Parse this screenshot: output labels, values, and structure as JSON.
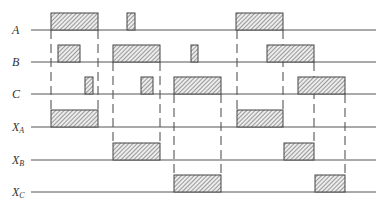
{
  "diagram": {
    "type": "timing-diagram",
    "line_x_start": 31,
    "line_x_end": 376,
    "pulse_height": 17,
    "colors": {
      "line": "#555555",
      "hatch": "#555555",
      "fill": "#e8e8e8"
    },
    "signals": [
      {
        "id": "A",
        "label": "A",
        "sub": "",
        "baseline_y": 30,
        "pulses": [
          {
            "x1": 51,
            "x2": 98
          },
          {
            "x1": 127,
            "x2": 135
          },
          {
            "x1": 236,
            "x2": 283
          }
        ]
      },
      {
        "id": "B",
        "label": "B",
        "sub": "",
        "baseline_y": 62,
        "pulses": [
          {
            "x1": 58,
            "x2": 80
          },
          {
            "x1": 113,
            "x2": 160
          },
          {
            "x1": 191,
            "x2": 198
          },
          {
            "x1": 267,
            "x2": 314
          }
        ]
      },
      {
        "id": "C",
        "label": "C",
        "sub": "",
        "baseline_y": 94,
        "pulses": [
          {
            "x1": 85,
            "x2": 93
          },
          {
            "x1": 141,
            "x2": 153
          },
          {
            "x1": 174,
            "x2": 221
          },
          {
            "x1": 298,
            "x2": 345
          }
        ]
      },
      {
        "id": "XA",
        "label": "X",
        "sub": "A",
        "baseline_y": 127,
        "pulses": [
          {
            "x1": 51,
            "x2": 98
          },
          {
            "x1": 237,
            "x2": 283
          }
        ]
      },
      {
        "id": "XB",
        "label": "X",
        "sub": "B",
        "baseline_y": 160,
        "pulses": [
          {
            "x1": 113,
            "x2": 160
          },
          {
            "x1": 284,
            "x2": 314
          }
        ]
      },
      {
        "id": "XC",
        "label": "X",
        "sub": "C",
        "baseline_y": 192,
        "pulses": [
          {
            "x1": 174,
            "x2": 221
          },
          {
            "x1": 315,
            "x2": 345
          }
        ]
      }
    ],
    "guides": [
      {
        "x": 51,
        "y1": 30,
        "y2": 110
      },
      {
        "x": 98,
        "y1": 30,
        "y2": 110
      },
      {
        "x": 113,
        "y1": 62,
        "y2": 143
      },
      {
        "x": 160,
        "y1": 62,
        "y2": 143
      },
      {
        "x": 174,
        "y1": 94,
        "y2": 175
      },
      {
        "x": 221,
        "y1": 94,
        "y2": 175
      },
      {
        "x": 237,
        "y1": 30,
        "y2": 110
      },
      {
        "x": 283,
        "y1": 30,
        "y2": 110
      },
      {
        "x": 314,
        "y1": 62,
        "y2": 143
      },
      {
        "x": 345,
        "y1": 94,
        "y2": 175
      }
    ]
  }
}
